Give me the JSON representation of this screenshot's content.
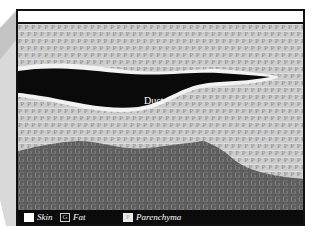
{
  "diagram": {
    "structures": [
      {
        "name": "Skin",
        "region": "top white band"
      },
      {
        "name": "Duct",
        "region": "black elongated shape with white border"
      },
      {
        "name": "Parenchyma",
        "fill_letter": "P",
        "region": "light grey area"
      },
      {
        "name": "Glandular",
        "fill_letter": "G",
        "region": "dark grey lower area"
      }
    ],
    "duct_label": "Duct",
    "parenchyma_letter": "P",
    "glandular_letter": "G"
  },
  "legend": {
    "items": [
      {
        "label": "Skin",
        "swatch": ""
      },
      {
        "label": "Fat",
        "swatch": "G"
      },
      {
        "label": "Parenchyma",
        "swatch": "P"
      }
    ]
  },
  "colors": {
    "frame": "#111111",
    "parenchyma": "#cdcdcd",
    "glandular": "#5a5a5a",
    "duct": "#0a0a0a",
    "legend_bg": "#0c0c0c"
  }
}
